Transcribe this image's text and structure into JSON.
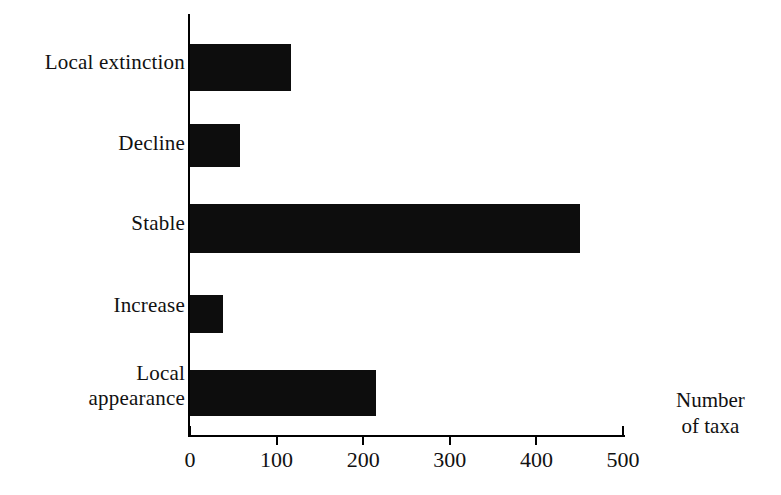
{
  "chart_data": {
    "type": "bar",
    "orientation": "horizontal",
    "title": "",
    "xlabel": "Number\nof taxa",
    "ylabel": "",
    "categories": [
      "Local extinction",
      "Decline",
      "Stable",
      "Increase",
      "Local\nappearance"
    ],
    "values": [
      117,
      58,
      450,
      38,
      215
    ],
    "xlim": [
      0,
      500
    ],
    "xticks": [
      0,
      100,
      200,
      300,
      400,
      500
    ],
    "xtick_labels": [
      "0",
      "100",
      "200",
      "300",
      "400",
      "500"
    ],
    "grid": false,
    "legend": null,
    "bar_color": "#0d0d0d"
  },
  "axis": {
    "title_line1": "Number",
    "title_line2": "of taxa"
  }
}
